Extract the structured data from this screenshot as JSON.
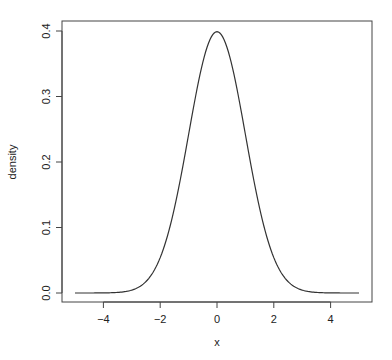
{
  "chart_data": {
    "type": "line",
    "title": "",
    "xlabel": "x",
    "ylabel": "density",
    "xlim": [
      -5,
      5
    ],
    "ylim": [
      0,
      0.4
    ],
    "grid": false,
    "legend": null,
    "x_ticks": [
      -4,
      -2,
      0,
      2,
      4
    ],
    "x_tick_labels": [
      "−4",
      "−2",
      "0",
      "2",
      "4"
    ],
    "y_ticks": [
      0.0,
      0.1,
      0.2,
      0.3,
      0.4
    ],
    "y_tick_labels": [
      "0.0",
      "0.1",
      "0.2",
      "0.3",
      "0.4"
    ],
    "series": [
      {
        "name": "standard normal density",
        "color": "#333333",
        "x": [
          -5,
          -4.5,
          -4,
          -3.5,
          -3,
          -2.5,
          -2,
          -1.5,
          -1,
          -0.5,
          0,
          0.5,
          1,
          1.5,
          2,
          2.5,
          3,
          3.5,
          4,
          4.5,
          5
        ],
        "y": [
          1.5e-06,
          1.6e-05,
          0.000134,
          0.000873,
          0.004432,
          0.017528,
          0.053991,
          0.129518,
          0.241971,
          0.352065,
          0.398942,
          0.352065,
          0.241971,
          0.129518,
          0.053991,
          0.017528,
          0.004432,
          0.000873,
          0.000134,
          1.6e-05,
          1.5e-06
        ]
      }
    ]
  }
}
